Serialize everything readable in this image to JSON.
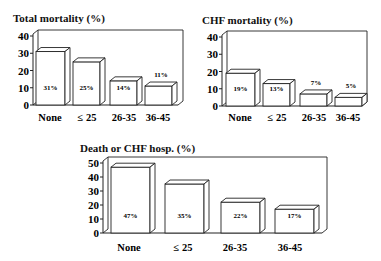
{
  "chart_data": [
    {
      "type": "bar",
      "title": "Total mortality (%)",
      "categories": [
        "None",
        "≤ 25",
        "26-35",
        "36-45"
      ],
      "values": [
        31,
        25,
        14,
        11
      ],
      "value_labels": [
        "31%",
        "25%",
        "14%",
        "11%"
      ],
      "yticks": [
        "0",
        "10",
        "20",
        "30",
        "40"
      ],
      "ylim": [
        0,
        40
      ],
      "xlabel": "",
      "ylabel": "",
      "style": "3d-outline",
      "grid": false,
      "legend": null
    },
    {
      "type": "bar",
      "title": "CHF mortality (%)",
      "categories": [
        "None",
        "≤ 25",
        "26-35",
        "36-45"
      ],
      "values": [
        19,
        13,
        7,
        5
      ],
      "value_labels": [
        "19%",
        "13%",
        "7%",
        "5%"
      ],
      "yticks": [
        "0",
        "10",
        "20",
        "30",
        "40"
      ],
      "ylim": [
        0,
        40
      ],
      "xlabel": "",
      "ylabel": "",
      "style": "3d-outline",
      "grid": false,
      "legend": null
    },
    {
      "type": "bar",
      "title": "Death or CHF hosp. (%)",
      "categories": [
        "None",
        "≤ 25",
        "26-35",
        "36-45"
      ],
      "values": [
        47,
        35,
        22,
        17
      ],
      "value_labels": [
        "47%",
        "35%",
        "22%",
        "17%"
      ],
      "yticks": [
        "0",
        "10",
        "20",
        "30",
        "40",
        "50"
      ],
      "ylim": [
        0,
        50
      ],
      "xlabel": "",
      "ylabel": "",
      "style": "3d-outline",
      "grid": false,
      "legend": null
    }
  ]
}
